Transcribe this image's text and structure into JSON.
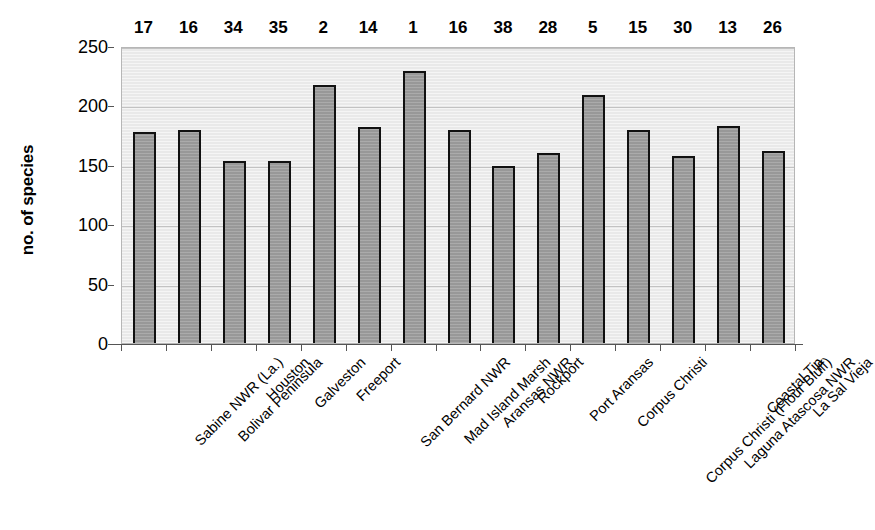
{
  "chart_data": {
    "type": "bar",
    "title": "",
    "subtitle": "",
    "xlabel": "",
    "ylabel": "no. of species",
    "ylim": [
      0,
      250
    ],
    "yticks": [
      0,
      50,
      100,
      150,
      200,
      250
    ],
    "ytick_labels": [
      "0",
      "50",
      "100",
      "150",
      "200",
      "250"
    ],
    "grid": true,
    "legend": "none",
    "bar_color": "#989898",
    "bar_edge_color": "#111111",
    "plot_background": "#e9e9e9",
    "gridline_color": "#c2c2c2",
    "categories": [
      "Sabine NWR (La.)",
      "Bolivar Peninsula",
      "Houston",
      "Galveston",
      "Freeport",
      "San Bernard NWR",
      "Mad Island Marsh",
      "Aransas NWR",
      "Rockport",
      "Port Aransas",
      "Corpus Christi",
      "Corpus Christi (Flour Bluff)",
      "Laguna Atascosa NWR",
      "Coastal Tip",
      "La Sal Vieja"
    ],
    "values": [
      178,
      179,
      153,
      153,
      217,
      182,
      229,
      179,
      149,
      160,
      209,
      179,
      157,
      183,
      162
    ],
    "point_labels": [
      "17",
      "16",
      "34",
      "35",
      "2",
      "14",
      "1",
      "16",
      "38",
      "28",
      "5",
      "15",
      "30",
      "13",
      "26"
    ],
    "point_label_meaning": "national rank number printed above each bar"
  }
}
